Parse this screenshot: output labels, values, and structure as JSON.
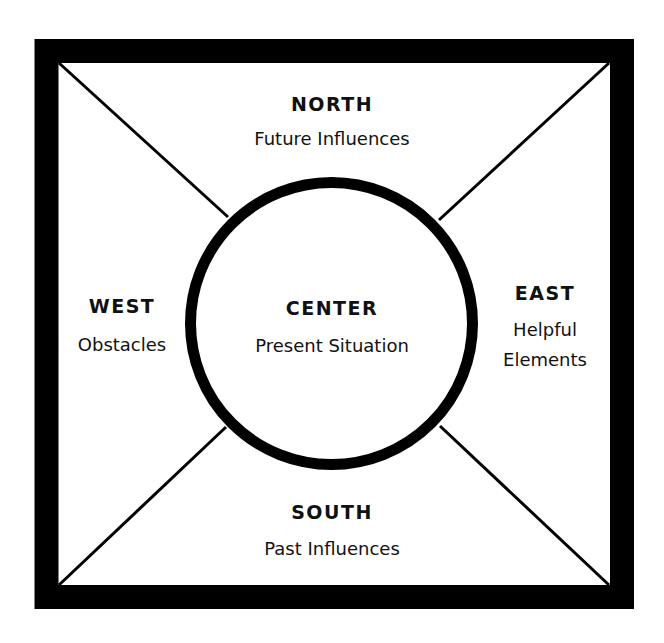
{
  "diagram": {
    "type": "compass-quadrant",
    "colors": {
      "stroke": "#000000",
      "background": "#ffffff",
      "text": "#111111"
    },
    "north": {
      "heading": "NORTH",
      "description": [
        "Future Influences"
      ]
    },
    "south": {
      "heading": "SOUTH",
      "description": [
        "Past Influences"
      ]
    },
    "west": {
      "heading": "WEST",
      "description": [
        "Obstacles"
      ]
    },
    "east": {
      "heading": "EAST",
      "description": [
        "Helpful",
        "Elements"
      ]
    },
    "center": {
      "heading": "CENTER",
      "description": [
        "Present Situation"
      ]
    }
  }
}
